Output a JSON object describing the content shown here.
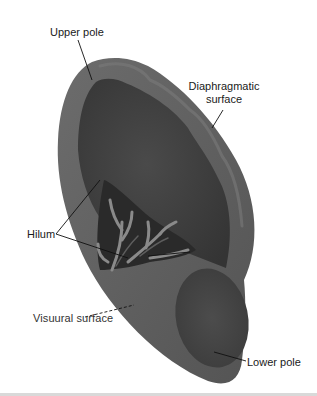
{
  "figure": {
    "labels": {
      "upper_pole": "Upper pole",
      "diaphragmatic_surface_line1": "Diaphragmatic",
      "diaphragmatic_surface_line2": "surface",
      "hilum": "Hilum",
      "visceral_surface": "Visuural surface",
      "lower_pole": "Lower pole"
    },
    "colors": {
      "organ_rim": "#5f5f5f",
      "organ_body": "#3f3f3f",
      "vessels": "#8a8a8a",
      "leader_lines": "#111111",
      "background": "#ffffff"
    }
  }
}
